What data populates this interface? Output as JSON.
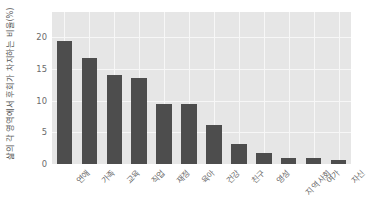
{
  "chart_data": {
    "type": "bar",
    "title": "",
    "xlabel": "",
    "ylabel": "삶의 각 영역에서 후회가 차지하는 비율(%)",
    "categories": [
      "연애",
      "가족",
      "교육",
      "직업",
      "재정",
      "육아",
      "건강",
      "친구",
      "영성",
      "지역사회",
      "여가",
      "자신"
    ],
    "values": [
      19.5,
      16.8,
      14.1,
      13.6,
      9.4,
      9.4,
      6.1,
      3.2,
      1.8,
      0.9,
      0.9,
      0.7
    ],
    "ylim": [
      0,
      24
    ],
    "yticks": [
      0,
      5,
      10,
      15,
      20
    ],
    "ytick_labels": [
      "0",
      "5",
      "10",
      "15",
      "20"
    ],
    "grid": true,
    "legend": "none",
    "bar_color": "#4d4d4d",
    "plot_background": "#e6e6e6",
    "grid_color": "#f7f7f7",
    "tick_label_color": "#6b6b6b",
    "axis_label_color": "#555555",
    "xtick_rotation": 45
  }
}
